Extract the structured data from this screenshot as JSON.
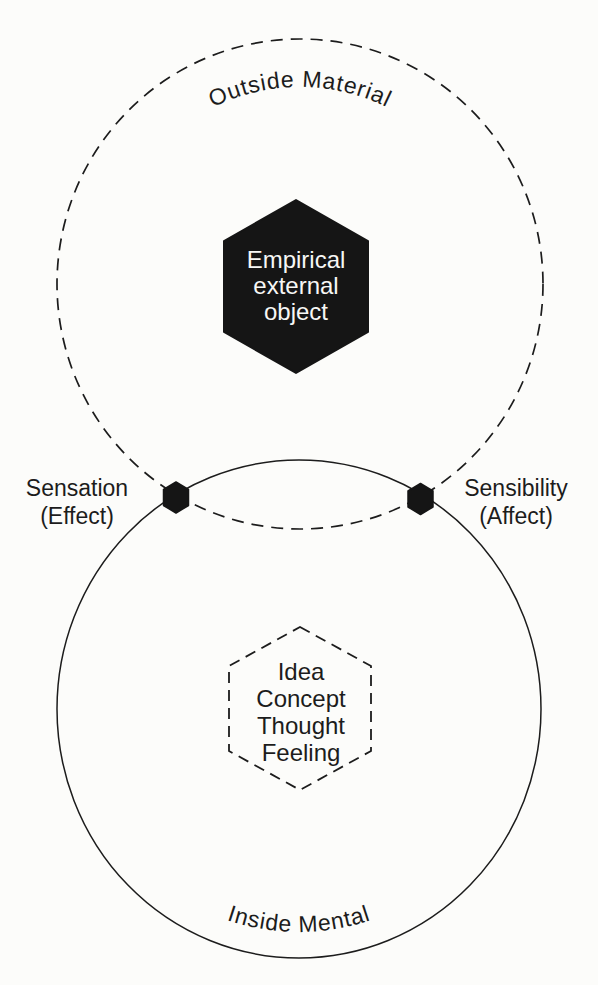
{
  "canvas": {
    "background_color": "#fcfcfa",
    "ink_color": "#1c1c1c",
    "hexagon_text_color": "#f7f7f5"
  },
  "outer_realm": {
    "label": "Outside Material",
    "circle_style": "dashed"
  },
  "inner_realm": {
    "label": "Inside Mental",
    "circle_style": "solid"
  },
  "empirical_hexagon": {
    "style": "solid-black",
    "lines": [
      "Empirical",
      "external",
      "object"
    ]
  },
  "mental_hexagon": {
    "style": "dashed-outline",
    "lines": [
      "Idea",
      "Concept",
      "Thought",
      "Feeling"
    ]
  },
  "left_junction": {
    "marker": "small-black-hexagon",
    "lines": [
      "Sensation",
      "(Effect)"
    ]
  },
  "right_junction": {
    "marker": "small-black-hexagon",
    "lines": [
      "Sensibility",
      "(Affect)"
    ]
  }
}
